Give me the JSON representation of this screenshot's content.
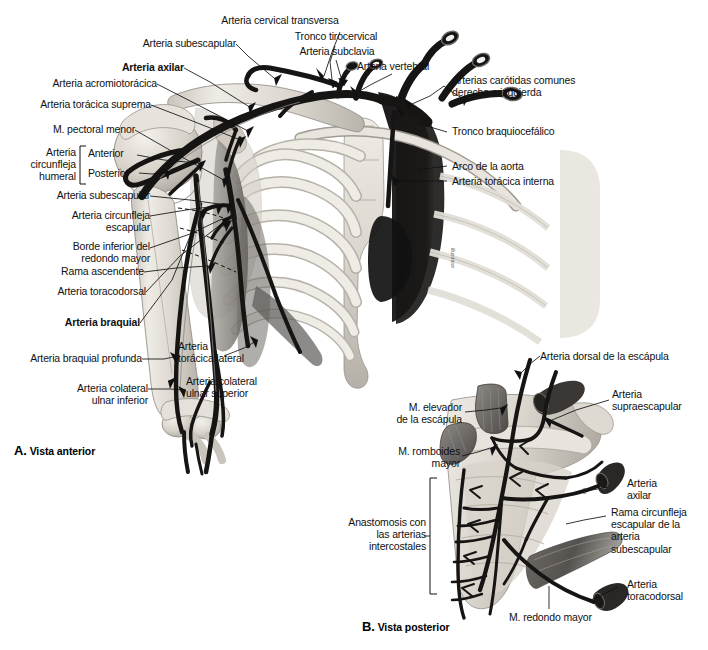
{
  "figure": {
    "type": "anatomical-illustration",
    "language": "es",
    "background_color": "#ffffff",
    "ink_color": "#111111",
    "panels": [
      {
        "id": "A",
        "letter": "A.",
        "title": "Vista anterior"
      },
      {
        "id": "B",
        "letter": "B.",
        "title": "Vista posterior"
      }
    ]
  },
  "panel_a": {
    "labels": [
      {
        "id": "a1",
        "text": "Arteria cervical transversa",
        "align": "c",
        "bold": false
      },
      {
        "id": "a2",
        "text": "Tronco tirocervical",
        "align": "c",
        "bold": false
      },
      {
        "id": "a3",
        "text": "Arteria subclavia",
        "align": "c",
        "bold": false
      },
      {
        "id": "a4",
        "text": "Arteria vertebral",
        "align": "c",
        "bold": false
      },
      {
        "id": "a5",
        "text": "Arterias carótidas comunes\nderecha e izquierda",
        "align": "l",
        "bold": false
      },
      {
        "id": "a6",
        "text": "Tronco braquiocefálico",
        "align": "l",
        "bold": false
      },
      {
        "id": "a7",
        "text": "Arco de la aorta",
        "align": "l",
        "bold": false
      },
      {
        "id": "a8",
        "text": "Arteria torácica interna",
        "align": "l",
        "bold": false
      },
      {
        "id": "a9",
        "text": "Arteria subescapular",
        "align": "r",
        "bold": false
      },
      {
        "id": "a10",
        "text": "Arteria axilar",
        "align": "r",
        "bold": true
      },
      {
        "id": "a11",
        "text": "Arteria acromiotorácica",
        "align": "r",
        "bold": false
      },
      {
        "id": "a12",
        "text": "Arteria torácica suprema",
        "align": "r",
        "bold": false
      },
      {
        "id": "a13",
        "text": "M. pectoral menor",
        "align": "r",
        "bold": false
      },
      {
        "id": "a14",
        "text": "Arteria\ncircunfleja\nhumeral",
        "align": "r",
        "bold": false
      },
      {
        "id": "a15",
        "text": "Anterior",
        "align": "l",
        "bold": false
      },
      {
        "id": "a16",
        "text": "Posterior",
        "align": "l",
        "bold": false
      },
      {
        "id": "a17",
        "text": "Arteria subescapular",
        "align": "r",
        "bold": false
      },
      {
        "id": "a18",
        "text": "Arteria circunfleja\nescapular",
        "align": "r",
        "bold": false
      },
      {
        "id": "a19",
        "text": "Borde inferior del\nredondo mayor",
        "align": "r",
        "bold": false
      },
      {
        "id": "a20",
        "text": "Rama ascendente",
        "align": "r",
        "bold": false
      },
      {
        "id": "a21",
        "text": "Arteria toracodorsal",
        "align": "r",
        "bold": false
      },
      {
        "id": "a22",
        "text": "Arteria braquial",
        "align": "r",
        "bold": true
      },
      {
        "id": "a23",
        "text": "Arteria braquial profunda",
        "align": "r",
        "bold": false
      },
      {
        "id": "a24",
        "text": "Arteria colateral\nulnar inferior",
        "align": "r",
        "bold": false
      },
      {
        "id": "a25",
        "text": "Arteria\ntorácica lateral",
        "align": "l",
        "bold": false
      },
      {
        "id": "a26",
        "text": "Arteria colateral\nulnar superior",
        "align": "l",
        "bold": false
      }
    ]
  },
  "panel_b": {
    "labels": [
      {
        "id": "b1",
        "text": "Arteria dorsal de la escápula",
        "align": "l",
        "bold": false
      },
      {
        "id": "b2",
        "text": "Arteria\nsupraescapular",
        "align": "l",
        "bold": false
      },
      {
        "id": "b3",
        "text": "Arteria\naxilar",
        "align": "l",
        "bold": false
      },
      {
        "id": "b4",
        "text": "Rama circunfleja\nescapular de la\narteria\nsubescapular",
        "align": "l",
        "bold": false
      },
      {
        "id": "b5",
        "text": "Arteria\ntoracodorsal",
        "align": "l",
        "bold": false
      },
      {
        "id": "b6",
        "text": "M. elevador\nde la escápula",
        "align": "r",
        "bold": false
      },
      {
        "id": "b7",
        "text": "M. romboides\nmayor",
        "align": "r",
        "bold": false
      },
      {
        "id": "b8",
        "text": "Anastomosis con\nlas arterias\nintercostales",
        "align": "r",
        "bold": false
      },
      {
        "id": "b9",
        "text": "M. redondo mayor",
        "align": "l",
        "bold": false
      }
    ]
  }
}
